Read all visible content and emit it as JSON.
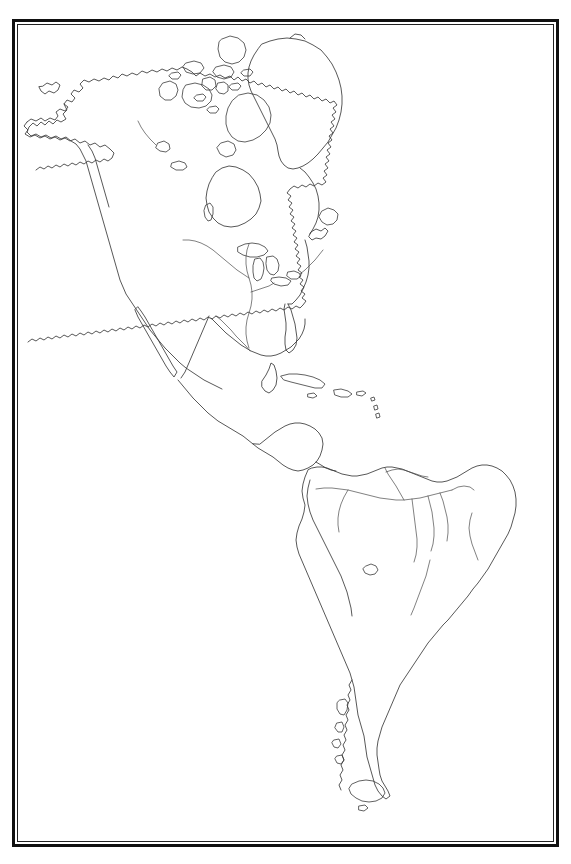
{
  "document": {
    "kind": "outline-map",
    "title": "Outline Map of the Americas",
    "subject": "Western Hemisphere — North America, Central America, South America, Greenland",
    "projection_look": "equirectangular-like outline",
    "background_color": "#ffffff",
    "coastline_color": "#3a3a3a",
    "river_color": "#4a4a4a",
    "frame_color": "#111111",
    "labels_present": "none",
    "legend_present": "none",
    "graticule_present": "none",
    "fill_style": "unfilled (blank outline map)"
  },
  "frame": {
    "style": "double-rule rectangle",
    "outer": {
      "x": 12,
      "y": 19,
      "width": 547,
      "height": 828,
      "stroke_width": 3
    },
    "inner": {
      "x": 17,
      "y": 24,
      "width": 537,
      "height": 818,
      "stroke_width": 1
    }
  },
  "features": {
    "landmasses": [
      "North America",
      "Greenland",
      "Canadian Arctic Archipelago",
      "Central America",
      "Caribbean islands",
      "South America",
      "Tierra del Fuego"
    ],
    "water_bodies": [
      "Hudson Bay",
      "Great Lakes",
      "Gulf of Mexico",
      "Caribbean Sea",
      "Lake Titicaca",
      "Gulf of California"
    ],
    "rivers": [
      "Mississippi",
      "Missouri",
      "Mackenzie",
      "Amazon",
      "Rio Negro",
      "Madeira",
      "Tapajos",
      "Xingu",
      "Orinoco",
      "Parana",
      "Sao Francisco"
    ],
    "notable_peninsulas": [
      "Alaska",
      "Baja California",
      "Florida",
      "Yucatan",
      "Labrador",
      "Nova Scotia"
    ]
  }
}
